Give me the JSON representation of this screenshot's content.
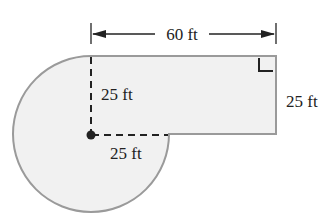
{
  "figure": {
    "labels": {
      "top_width": "60 ft",
      "vertical_radius": "25 ft",
      "horizontal_radius": "25 ft",
      "right_height": "25 ft"
    },
    "dimensions": {
      "rectangle_width_ft": 60,
      "rectangle_height_ft": 25,
      "circle_radius_ft": 25,
      "circle_fraction": "3/4"
    },
    "colors": {
      "fill": "#f1f1f1",
      "outline": "#999999",
      "dim_lines": "#222222",
      "dashed_lines": "#222222"
    },
    "markers": {
      "right_angle": "right-angle-marker",
      "center_point": "center-dot"
    }
  }
}
